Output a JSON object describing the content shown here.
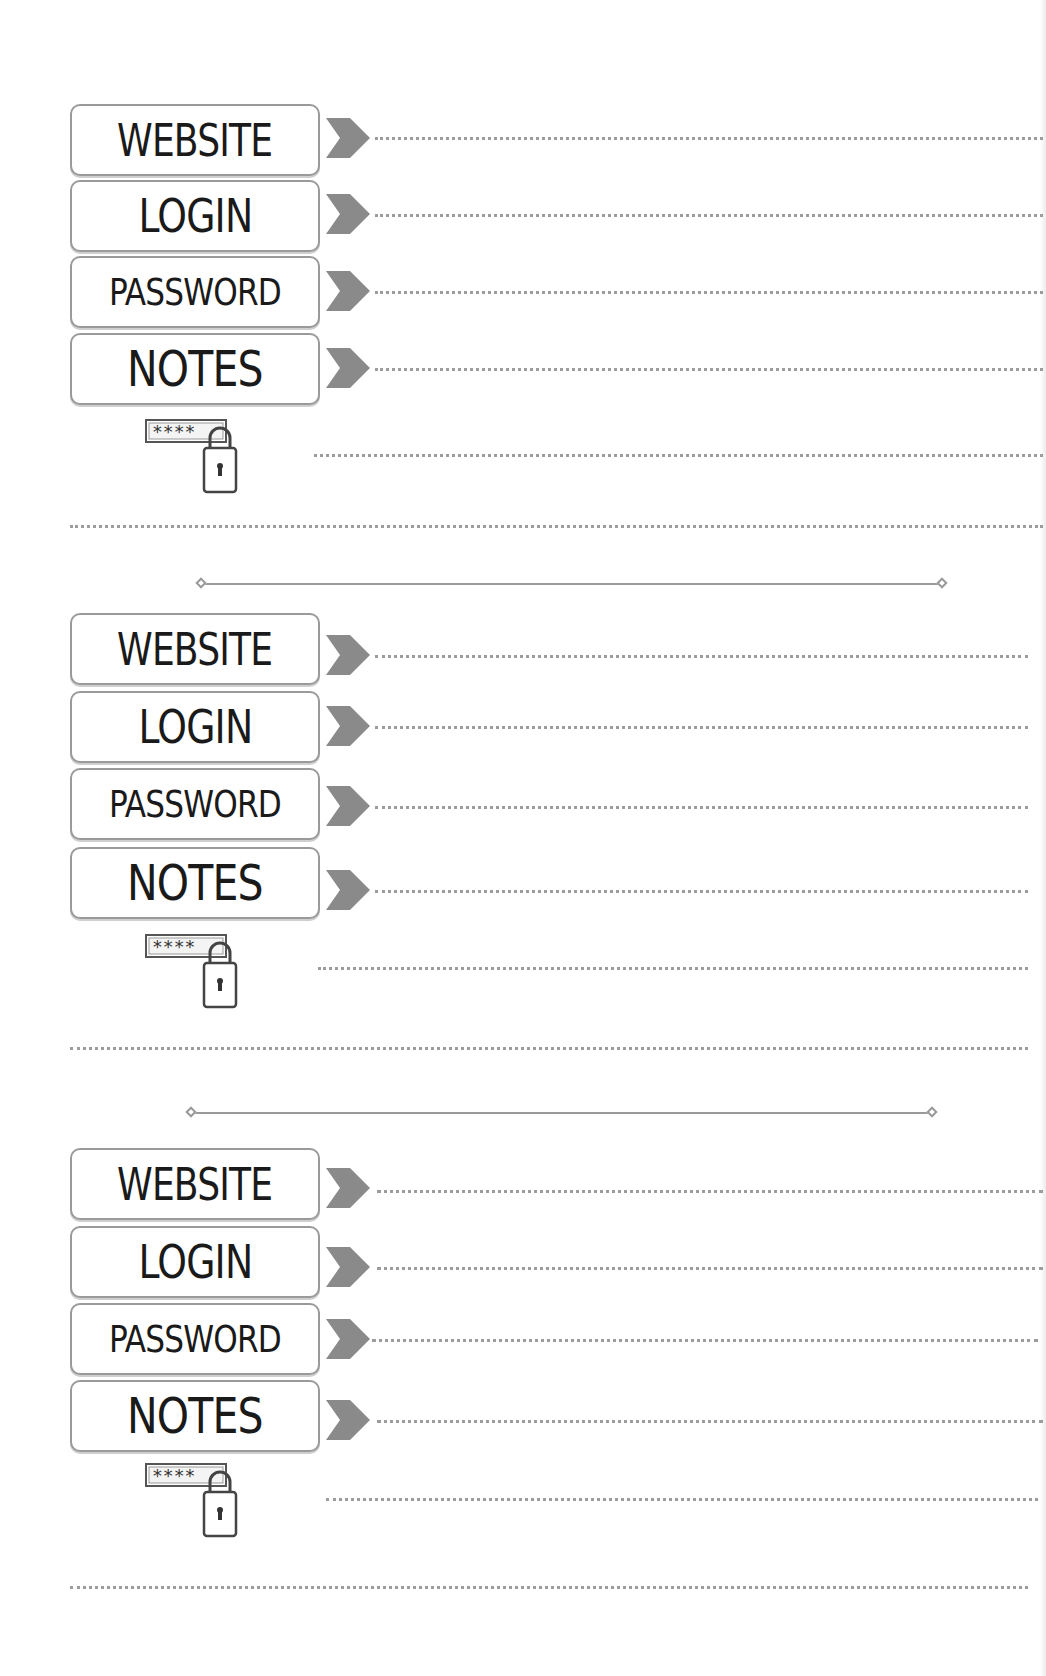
{
  "page": {
    "background": "#ffffff",
    "line_color": "#9c9c9c",
    "chevron_color": "#8a8a8a"
  },
  "entries": [
    {
      "fields": [
        {
          "label": "WEBSITE",
          "value": ""
        },
        {
          "label": "LOGIN",
          "value": ""
        },
        {
          "label": "PASSWORD",
          "value": ""
        },
        {
          "label": "NOTES",
          "value": ""
        }
      ],
      "extra_note": "",
      "icon": "password-lock-icon"
    },
    {
      "fields": [
        {
          "label": "WEBSITE",
          "value": ""
        },
        {
          "label": "LOGIN",
          "value": ""
        },
        {
          "label": "PASSWORD",
          "value": ""
        },
        {
          "label": "NOTES",
          "value": ""
        }
      ],
      "extra_note": "",
      "icon": "password-lock-icon"
    },
    {
      "fields": [
        {
          "label": "WEBSITE",
          "value": ""
        },
        {
          "label": "LOGIN",
          "value": ""
        },
        {
          "label": "PASSWORD",
          "value": ""
        },
        {
          "label": "NOTES",
          "value": ""
        }
      ],
      "extra_note": "",
      "icon": "password-lock-icon"
    }
  ],
  "lock_icon": {
    "mask_text": "****"
  }
}
